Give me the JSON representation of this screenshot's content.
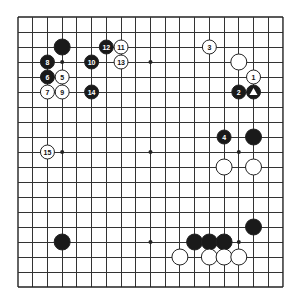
{
  "board": {
    "size": 19,
    "origin_x": 18,
    "origin_y": 17,
    "step_x": 14.72,
    "step_y": 15.0,
    "line_color": "#333333",
    "black_color": "#1a1a1a",
    "white_color": "#ffffff",
    "star_points": [
      [
        3,
        3
      ],
      [
        9,
        3
      ],
      [
        15,
        3
      ],
      [
        3,
        9
      ],
      [
        9,
        9
      ],
      [
        15,
        9
      ],
      [
        3,
        15
      ],
      [
        9,
        15
      ],
      [
        15,
        15
      ]
    ]
  },
  "stones": [
    {
      "color": "black",
      "col": 3,
      "row": 2,
      "label": ""
    },
    {
      "color": "black",
      "col": 2,
      "row": 3,
      "label": "8"
    },
    {
      "color": "black",
      "col": 5,
      "row": 3,
      "label": "10"
    },
    {
      "color": "black",
      "col": 6,
      "row": 2,
      "label": "12"
    },
    {
      "color": "white",
      "col": 7,
      "row": 2,
      "label": "11"
    },
    {
      "color": "white",
      "col": 7,
      "row": 3,
      "label": "13"
    },
    {
      "color": "black",
      "col": 2,
      "row": 4,
      "label": "6"
    },
    {
      "color": "white",
      "col": 3,
      "row": 4,
      "label": "5"
    },
    {
      "color": "white",
      "col": 2,
      "row": 5,
      "label": "7"
    },
    {
      "color": "white",
      "col": 3,
      "row": 5,
      "label": "9"
    },
    {
      "color": "black",
      "col": 5,
      "row": 5,
      "label": "14"
    },
    {
      "color": "white",
      "col": 13,
      "row": 2,
      "label": "3"
    },
    {
      "color": "white",
      "col": 15,
      "row": 3,
      "label": ""
    },
    {
      "color": "white",
      "col": 16,
      "row": 4,
      "label": "1"
    },
    {
      "color": "black",
      "col": 15,
      "row": 5,
      "label": "2"
    },
    {
      "color": "black",
      "col": 16,
      "row": 5,
      "label": "triangle"
    },
    {
      "color": "black",
      "col": 14,
      "row": 8,
      "label": "4"
    },
    {
      "color": "black",
      "col": 16,
      "row": 8,
      "label": ""
    },
    {
      "color": "white",
      "col": 14,
      "row": 10,
      "label": ""
    },
    {
      "color": "white",
      "col": 16,
      "row": 10,
      "label": ""
    },
    {
      "color": "white",
      "col": 2,
      "row": 9,
      "label": "15"
    },
    {
      "color": "black",
      "col": 16,
      "row": 14,
      "label": ""
    },
    {
      "color": "black",
      "col": 12,
      "row": 15,
      "label": ""
    },
    {
      "color": "black",
      "col": 13,
      "row": 15,
      "label": ""
    },
    {
      "color": "black",
      "col": 14,
      "row": 15,
      "label": ""
    },
    {
      "color": "white",
      "col": 11,
      "row": 16,
      "label": ""
    },
    {
      "color": "white",
      "col": 13,
      "row": 16,
      "label": ""
    },
    {
      "color": "white",
      "col": 14,
      "row": 16,
      "label": ""
    },
    {
      "color": "white",
      "col": 15,
      "row": 16,
      "label": ""
    },
    {
      "color": "black",
      "col": 3,
      "row": 15,
      "label": ""
    }
  ]
}
